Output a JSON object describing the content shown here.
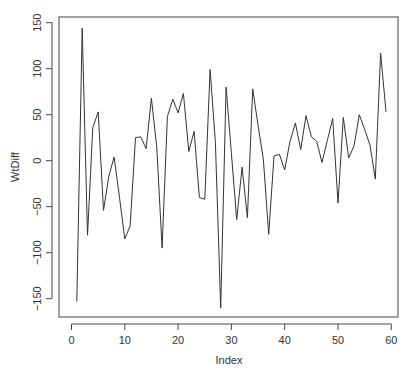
{
  "chart_data": {
    "type": "line",
    "title": "",
    "xlabel": "Index",
    "ylabel": "WtDiff",
    "xlim": [
      0,
      61
    ],
    "ylim": [
      -170,
      152
    ],
    "xticks": [
      0,
      10,
      20,
      30,
      40,
      50,
      60
    ],
    "yticks": [
      -150,
      -100,
      -50,
      0,
      50,
      100,
      150
    ],
    "grid": false,
    "legend": null,
    "line_color": "#333333",
    "x": [
      1,
      2,
      3,
      4,
      5,
      6,
      7,
      8,
      9,
      10,
      11,
      12,
      13,
      14,
      15,
      16,
      17,
      18,
      19,
      20,
      21,
      22,
      23,
      24,
      25,
      26,
      27,
      28,
      29,
      30,
      31,
      32,
      33,
      34,
      35,
      36,
      37,
      38,
      39,
      40,
      41,
      42,
      43,
      44,
      45,
      46,
      47,
      48,
      49,
      50,
      51,
      52,
      53,
      54,
      55,
      56,
      57,
      58,
      59
    ],
    "series": [
      {
        "name": "WtDiff",
        "values": [
          -153,
          144,
          -81,
          36,
          53,
          -54,
          -17,
          4,
          -40,
          -85,
          -71,
          25,
          26,
          13,
          68,
          14,
          -95,
          48,
          67,
          52,
          73,
          10,
          32,
          -40,
          -42,
          99,
          20,
          -160,
          80,
          8,
          -64,
          -7,
          -62,
          78,
          38,
          1,
          -80,
          5,
          7,
          -10,
          21,
          41,
          12,
          49,
          26,
          21,
          -2,
          22,
          46,
          -46,
          47,
          3,
          16,
          50,
          34,
          17,
          -20,
          117,
          53
        ]
      }
    ]
  }
}
